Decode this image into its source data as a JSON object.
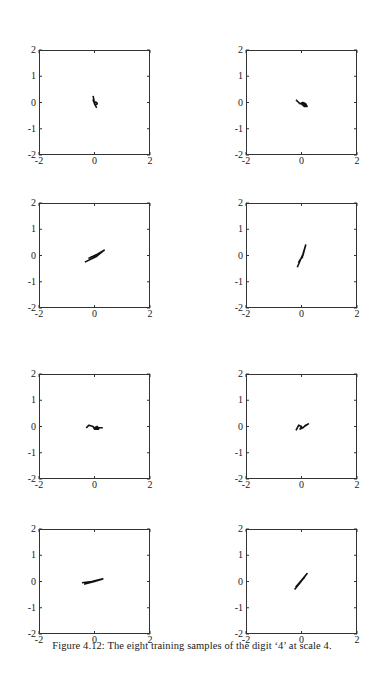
{
  "figure": {
    "caption": "Figure 4.12: The eight training samples of the digit ‘4’ at scale 4."
  },
  "axes": {
    "xticks": [
      "-2",
      "0",
      "2"
    ],
    "yticks": [
      "2",
      "1",
      "0",
      "-1",
      "-2"
    ]
  },
  "chart_data": {
    "type": "line",
    "layout": "4 rows x 2 columns grid of small line plots",
    "grid": false,
    "panels": [
      {
        "index": 1,
        "xlim": [
          -2,
          2
        ],
        "ylim": [
          -2,
          2
        ],
        "xticks": [
          -2,
          0,
          2
        ],
        "yticks": [
          -2,
          -1,
          0,
          1,
          2
        ],
        "description": "small '4'-shaped trace near origin",
        "x": [
          -0.05,
          -0.02,
          0.0,
          0.03,
          0.08,
          0.1,
          0.02,
          -0.05,
          0.05,
          0.08
        ],
        "y": [
          0.25,
          0.1,
          -0.05,
          0.02,
          0.0,
          -0.05,
          -0.1,
          0.1,
          -0.15,
          -0.2
        ]
      },
      {
        "index": 2,
        "xlim": [
          -2,
          2
        ],
        "ylim": [
          -2,
          2
        ],
        "xticks": [
          -2,
          0,
          2
        ],
        "yticks": [
          -2,
          -1,
          0,
          1,
          2
        ],
        "description": "small loop trace slightly right of origin, slanted",
        "x": [
          -0.2,
          -0.1,
          -0.05,
          0.05,
          0.15,
          0.2,
          0.1,
          0.0,
          0.1,
          0.15
        ],
        "y": [
          0.1,
          0.0,
          -0.05,
          0.0,
          -0.05,
          -0.15,
          -0.15,
          -0.05,
          -0.05,
          -0.15
        ]
      },
      {
        "index": 3,
        "xlim": [
          -2,
          2
        ],
        "ylim": [
          -2,
          2
        ],
        "xticks": [
          -2,
          0,
          2
        ],
        "yticks": [
          -2,
          -1,
          0,
          1,
          2
        ],
        "description": "elongated diagonal trace from lower-left to upper-right",
        "x": [
          -0.35,
          -0.1,
          0.05,
          0.35,
          0.1,
          -0.2,
          -0.1,
          0.05
        ],
        "y": [
          -0.25,
          -0.12,
          -0.05,
          0.2,
          0.05,
          -0.1,
          -0.05,
          0.0
        ]
      },
      {
        "index": 4,
        "xlim": [
          -2,
          2
        ],
        "ylim": [
          -2,
          2
        ],
        "xticks": [
          -2,
          0,
          2
        ],
        "yticks": [
          -2,
          -1,
          0,
          1,
          2
        ],
        "description": "steep diagonal trace crossing origin",
        "x": [
          -0.15,
          -0.05,
          0.05,
          0.15,
          0.05,
          -0.1,
          0.0,
          0.05
        ],
        "y": [
          -0.45,
          -0.2,
          0.05,
          0.4,
          0.0,
          -0.25,
          -0.1,
          -0.05
        ]
      },
      {
        "index": 5,
        "xlim": [
          -2,
          2
        ],
        "ylim": [
          -2,
          2
        ],
        "xticks": [
          -2,
          0,
          2
        ],
        "yticks": [
          -2,
          -1,
          0,
          1,
          2
        ],
        "description": "small horizontal loop trace near origin",
        "x": [
          -0.3,
          -0.2,
          -0.05,
          0.0,
          0.15,
          0.1,
          0.0,
          0.3
        ],
        "y": [
          -0.05,
          0.05,
          0.0,
          -0.1,
          -0.1,
          0.0,
          -0.05,
          -0.05
        ]
      },
      {
        "index": 6,
        "xlim": [
          -2,
          2
        ],
        "ylim": [
          -2,
          2
        ],
        "xticks": [
          -2,
          0,
          2
        ],
        "yticks": [
          -2,
          -1,
          0,
          1,
          2
        ],
        "description": "small slanted loop trace near origin",
        "x": [
          -0.2,
          -0.1,
          0.0,
          -0.05,
          0.05,
          0.15,
          0.25,
          0.1
        ],
        "y": [
          -0.15,
          0.05,
          0.0,
          -0.1,
          -0.05,
          0.05,
          0.1,
          0.0
        ]
      },
      {
        "index": 7,
        "xlim": [
          -2,
          2
        ],
        "ylim": [
          -2,
          2
        ],
        "xticks": [
          -2,
          0,
          2
        ],
        "yticks": [
          -2,
          -1,
          0,
          1,
          2
        ],
        "description": "flat elongated trace slightly tilted, left of origin",
        "x": [
          -0.45,
          -0.1,
          0.3,
          0.0,
          -0.35,
          0.15
        ],
        "y": [
          -0.05,
          0.0,
          0.1,
          0.0,
          -0.1,
          0.05
        ]
      },
      {
        "index": 8,
        "xlim": [
          -2,
          2
        ],
        "ylim": [
          -2,
          2
        ],
        "xticks": [
          -2,
          0,
          2
        ],
        "yticks": [
          -2,
          -1,
          0,
          1,
          2
        ],
        "description": "diagonal trace from lower-left to upper-right",
        "x": [
          -0.25,
          -0.05,
          0.2,
          0.0,
          -0.2,
          0.1,
          -0.1
        ],
        "y": [
          -0.3,
          -0.05,
          0.3,
          0.05,
          -0.2,
          0.15,
          -0.1
        ]
      }
    ]
  }
}
